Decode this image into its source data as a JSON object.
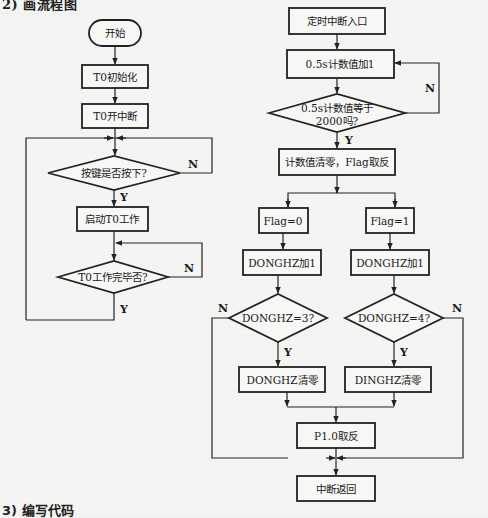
{
  "headings": {
    "section2": "2) 画流程图",
    "section3": "3) 编写代码"
  },
  "main_flow": {
    "start": "开始",
    "t0_init": "T0初始化",
    "t0_enable_interrupt": "T0开中断",
    "key_pressed_decision": "按键是否按下?",
    "start_t0": "启动T0工作",
    "t0_done_decision": "T0工作完毕否?",
    "yes": "Y",
    "no": "N"
  },
  "interrupt_flow": {
    "entry": "定时中断入口",
    "counter_inc": "0.5s计数值加1",
    "counter_decision_line1": "0.5s计数值等于",
    "counter_decision_line2": "2000吗?",
    "clear_toggle": "计数值清零，Flag取反",
    "flag0": "Flag=0",
    "flag1": "Flag=1",
    "donghz_inc_left": "DONGHZ加1",
    "donghz_inc_right": "DONGHZ加1",
    "donghz_eq3": "DONGHZ=3?",
    "donghz_eq4": "DONGHZ=4?",
    "donghz_clear": "DONGHZ清零",
    "dinghz_clear": "DINGHZ清零",
    "p10_toggle": "P1.0取反",
    "return": "中断返回",
    "yes": "Y",
    "no": "N"
  },
  "colors": {
    "background": "#f4f4f2",
    "stroke": "#222222",
    "text": "#1a1a1a"
  }
}
